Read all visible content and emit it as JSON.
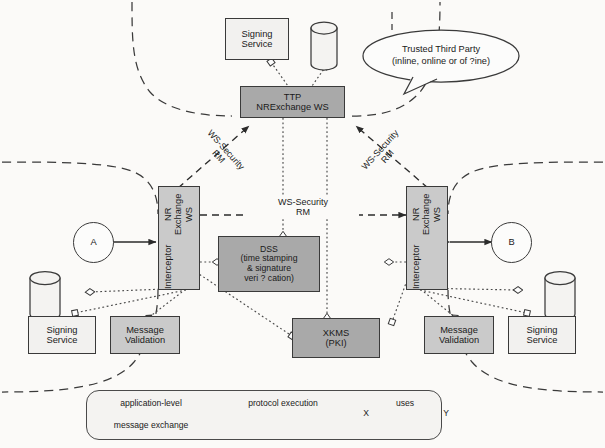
{
  "diagram": {
    "colors": {
      "fill_dark_gray": "#a9a9a9",
      "fill_light_gray": "#cacaca",
      "fill_white": "#f2f1ef",
      "stroke": "#3a3a3a",
      "background": "#fbfaf8"
    }
  },
  "nodes": {
    "ttp_signing_service": {
      "line1": "Signing",
      "line2": "Service"
    },
    "ttp_ws": {
      "line1": "TTP",
      "line2": "NRExchange WS"
    },
    "interceptor_left": {
      "line1": "Interceptor",
      "line2": "NR Exchange WS"
    },
    "interceptor_right": {
      "line1": "Interceptor",
      "line2": "NR Exchange WS"
    },
    "party_a": {
      "label": "A"
    },
    "party_b": {
      "label": "B"
    },
    "dss": {
      "line1": "DSS",
      "line2": "(time stamping",
      "line3": "& signature",
      "line4": "veri ? cation)"
    },
    "xkms": {
      "line1": "XKMS",
      "line2": "(PKI)"
    },
    "left_signing_service": {
      "line1": "Signing",
      "line2": "Service"
    },
    "left_message_validation": {
      "line1": "Message",
      "line2": "Validation"
    },
    "right_message_validation": {
      "line1": "Message",
      "line2": "Validation"
    },
    "right_signing_service": {
      "line1": "Signing",
      "line2": "Service"
    }
  },
  "callout": {
    "line1": "Trusted Third Party",
    "line2": "(inline, online or of ?ine)"
  },
  "edge_labels": {
    "center_channel": {
      "line1": "WS-Security",
      "line2": "RM"
    },
    "left_diagonal": {
      "line1": "WS-Security",
      "line2": "RM"
    },
    "right_diagonal": {
      "line1": "WS-Security",
      "line2": "RM"
    }
  },
  "legend": {
    "application_level": {
      "line1": "application-level",
      "line2": "message exchange"
    },
    "protocol_execution": {
      "label": "protocol execution"
    },
    "uses": {
      "from": "X",
      "label": "uses",
      "to": "Y"
    }
  }
}
